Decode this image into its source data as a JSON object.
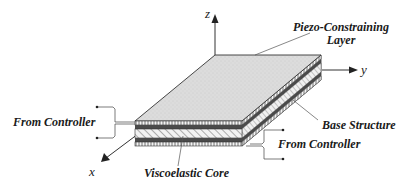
{
  "diagram": {
    "axes": {
      "x": "x",
      "y": "y",
      "z": "z"
    },
    "labels": {
      "piezo_line1": "Piezo-Constraining",
      "piezo_line2": "Layer",
      "base_structure": "Base Structure",
      "from_controller_left": "From Controller",
      "from_controller_right": "From Controller",
      "viscoelastic_core": "Viscoelastic Core"
    },
    "layers": [
      {
        "name": "Piezo-Constraining Layer (top)",
        "pattern": "vertical-lines"
      },
      {
        "name": "Dark layer (top)",
        "pattern": "solid-dark"
      },
      {
        "name": "Viscoelastic Core",
        "pattern": "diagonal-hatch"
      },
      {
        "name": "Dark layer (bottom)",
        "pattern": "solid-dark"
      },
      {
        "name": "Base Structure (bottom piezo)",
        "pattern": "vertical-lines"
      }
    ],
    "colors": {
      "top_surface": "#dcdcdc",
      "dark_layer": "#4a4a4a",
      "line": "#333333"
    }
  }
}
